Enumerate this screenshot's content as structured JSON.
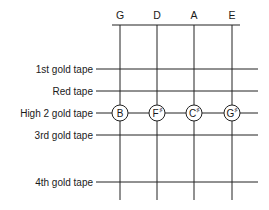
{
  "strings": [
    "G",
    "D",
    "A",
    "E"
  ],
  "tapes": [
    {
      "label": "1st gold tape",
      "notes": []
    },
    {
      "label": "Red tape",
      "notes": []
    },
    {
      "label": "High 2 gold tape",
      "notes": [
        {
          "letter": "B",
          "accidental": ""
        },
        {
          "letter": "F",
          "accidental": "♯"
        },
        {
          "letter": "C",
          "accidental": "♯"
        },
        {
          "letter": "G",
          "accidental": "♯"
        }
      ]
    },
    {
      "label": "3rd gold tape",
      "notes": []
    },
    {
      "label": "4th gold tape",
      "notes": []
    }
  ]
}
